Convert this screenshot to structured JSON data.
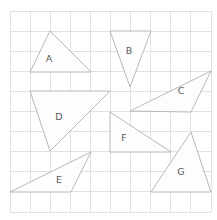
{
  "page": {
    "background_color": "#ffffff",
    "width": 217,
    "height": 220
  },
  "grid": {
    "name": "square-grid",
    "x0": 10,
    "y0": 11,
    "x1": 211,
    "y1": 212,
    "columns": 10,
    "rows": 10,
    "cell_width": 20.1,
    "cell_height": 20.1,
    "line_color": "#d9d9d9"
  },
  "style": {
    "shape_fill": "#fdfdfd",
    "shape_stroke": "#b0b0b0",
    "label_color": "#5a5a5a"
  },
  "chart_data": {
    "type": "scatter",
    "xlabel": "",
    "ylabel": "",
    "xlim": [
      10,
      211
    ],
    "ylim": [
      11,
      212
    ],
    "grid": true,
    "legend": "none",
    "shapes": [
      {
        "label": "A",
        "kind": "triangle",
        "points": "50,31 91,72 30,72",
        "label_x": 49,
        "label_y": 59
      },
      {
        "label": "B",
        "kind": "triangle",
        "points": "110,31 151,31 130,87",
        "label_x": 129,
        "label_y": 51
      },
      {
        "label": "C",
        "kind": "triangle",
        "points": "211,71 191,112 130,111",
        "label_x": 181,
        "label_y": 91
      },
      {
        "label": "D",
        "kind": "triangle",
        "points": "30,91 110,91 50,151",
        "label_x": 59,
        "label_y": 117
      },
      {
        "label": "E",
        "kind": "triangle",
        "points": "91,152 71,192 10,192",
        "label_x": 59,
        "label_y": 180
      },
      {
        "label": "F",
        "kind": "triangle",
        "points": "110,112 171,152 110,152",
        "label_x": 124,
        "label_y": 138
      },
      {
        "label": "G",
        "kind": "triangle",
        "points": "191,132 211,192 151,192",
        "label_x": 181,
        "label_y": 172
      }
    ]
  }
}
